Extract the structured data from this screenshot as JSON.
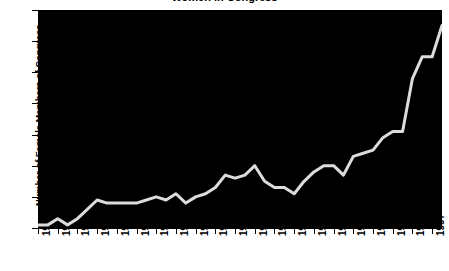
{
  "chart_data": {
    "type": "line",
    "title": "Women in Congress",
    "xlabel": "",
    "ylabel": "Number of Female Members of Congress",
    "xlim": [
      1917,
      1999
    ],
    "ylim": [
      0,
      70
    ],
    "ytick_labels": [
      "0",
      "10",
      "20",
      "30",
      "40",
      "50",
      "60",
      "70"
    ],
    "ytick_values": [
      0,
      10,
      20,
      30,
      40,
      50,
      60,
      70
    ],
    "xtick_labels": [
      "1917",
      "1921",
      "1925",
      "1929",
      "1933",
      "1937",
      "1941",
      "1945",
      "1949",
      "1953",
      "1957",
      "1961",
      "1965",
      "1969",
      "1973",
      "1977",
      "1981",
      "1985",
      "1989",
      "1993",
      "1997"
    ],
    "xtick_values": [
      1917,
      1921,
      1925,
      1929,
      1933,
      1937,
      1941,
      1945,
      1949,
      1953,
      1957,
      1961,
      1965,
      1969,
      1973,
      1977,
      1981,
      1985,
      1989,
      1993,
      1997
    ],
    "grid": false,
    "legend": null,
    "line_color": "#dcdcdc",
    "plot_background": "#000000",
    "figure_background": "#ffffff",
    "x": [
      1917,
      1919,
      1921,
      1923,
      1925,
      1927,
      1929,
      1931,
      1933,
      1935,
      1937,
      1939,
      1941,
      1943,
      1945,
      1947,
      1949,
      1951,
      1953,
      1955,
      1957,
      1959,
      1961,
      1963,
      1965,
      1967,
      1969,
      1971,
      1973,
      1975,
      1977,
      1979,
      1981,
      1983,
      1985,
      1987,
      1989,
      1991,
      1993,
      1995,
      1997,
      1999
    ],
    "values": [
      1,
      1,
      3,
      1,
      3,
      6,
      9,
      8,
      8,
      8,
      8,
      9,
      10,
      9,
      11,
      8,
      10,
      11,
      13,
      17,
      16,
      17,
      20,
      15,
      13,
      13,
      11,
      15,
      18,
      20,
      20,
      17,
      23,
      24,
      25,
      29,
      31,
      31,
      48,
      55,
      55,
      65
    ]
  }
}
